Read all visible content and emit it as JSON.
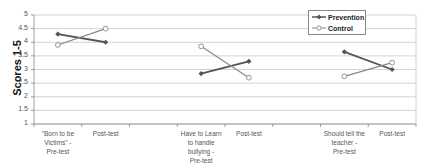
{
  "chart_data": {
    "type": "line",
    "title": "",
    "xlabel": "",
    "ylabel": "Scores 1-5",
    "ylim": [
      1,
      5
    ],
    "yticks": [
      "5",
      "4.5",
      "4",
      "3.5",
      "3",
      "2.5",
      "2",
      "1.5",
      "1"
    ],
    "grid": true,
    "legend_position": "top-right",
    "categories": [
      "\"Born to be Victims\" - Pre-test",
      "Post-test",
      "",
      "Have to Learn to handle bullying - Pre-test",
      "Post-test",
      "",
      "Should tell the teacher - Pre-test",
      "Post-test"
    ],
    "series": [
      {
        "name": "Prevention",
        "color": "#555555",
        "marker": "filled-diamond",
        "values": [
          4.3,
          4.0,
          null,
          2.85,
          3.3,
          null,
          3.65,
          3.0
        ]
      },
      {
        "name": "Control",
        "color": "#888888",
        "marker": "open-circle",
        "values": [
          3.9,
          4.5,
          null,
          3.85,
          2.7,
          null,
          2.75,
          3.25
        ]
      }
    ]
  },
  "axis": {
    "ylabel": "Scores 1-5"
  },
  "legend": {
    "prevention": "Prevention",
    "control": "Control"
  },
  "xticks": {
    "c0": [
      "\"Born to be",
      "Victims\" -",
      "Pre-test"
    ],
    "c1": [
      "Post-test"
    ],
    "c3": [
      "Have to Learn",
      "to handle",
      "bullying -",
      "Pre-test"
    ],
    "c4": [
      "Post-test"
    ],
    "c6": [
      "Should tell the",
      "teacher -",
      "Pre-test"
    ],
    "c7": [
      "Post-test"
    ]
  }
}
